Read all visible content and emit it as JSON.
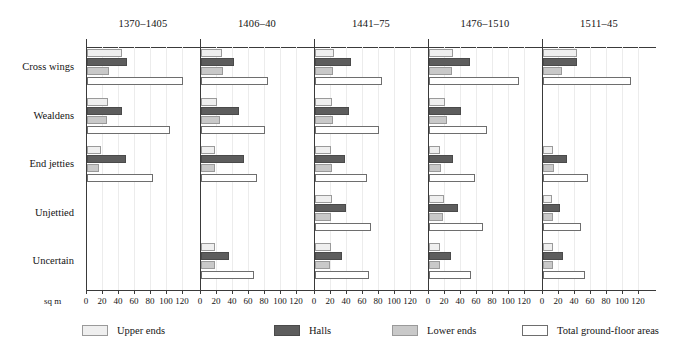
{
  "chart_data": {
    "type": "bar",
    "orientation": "horizontal",
    "title": "",
    "xlabel": "sq m",
    "ylabel": "",
    "xlim": [
      0,
      120
    ],
    "xticks": [
      0,
      20,
      40,
      60,
      80,
      100,
      120
    ],
    "grid": true,
    "legend_position": "bottom",
    "panel_titles": [
      "1370–1405",
      "1406–40",
      "1441–75",
      "1476–1510",
      "1511–45"
    ],
    "categories": [
      "Cross wings",
      "Wealdens",
      "End jetties",
      "Unjettied",
      "Uncertain"
    ],
    "series_names": [
      "Upper ends",
      "Halls",
      "Lower ends",
      "Total ground-floor areas"
    ],
    "series_colors": {
      "upper_ends": "#efefef",
      "halls": "#5d5d5d",
      "lower_ends": "#c9c9c9",
      "total_ground_floor_areas": "#ffffff"
    },
    "panels": [
      {
        "title": "1370–1405",
        "groups": [
          {
            "category": "Cross wings",
            "values": {
              "upper_ends": 44,
              "halls": 50,
              "lower_ends": 27,
              "total_ground_floor_areas": 120
            }
          },
          {
            "category": "Wealdens",
            "values": {
              "upper_ends": 26,
              "halls": 44,
              "lower_ends": 25,
              "total_ground_floor_areas": 104
            }
          },
          {
            "category": "End jetties",
            "values": {
              "upper_ends": 18,
              "halls": 49,
              "lower_ends": 15,
              "total_ground_floor_areas": 83
            }
          },
          {
            "category": "Unjettied",
            "values": {
              "upper_ends": 0,
              "halls": 0,
              "lower_ends": 0,
              "total_ground_floor_areas": 0
            }
          },
          {
            "category": "Uncertain",
            "values": {
              "upper_ends": 0,
              "halls": 0,
              "lower_ends": 0,
              "total_ground_floor_areas": 0
            }
          }
        ]
      },
      {
        "title": "1406–40",
        "groups": [
          {
            "category": "Cross wings",
            "values": {
              "upper_ends": 26,
              "halls": 41,
              "lower_ends": 28,
              "total_ground_floor_areas": 84
            }
          },
          {
            "category": "Wealdens",
            "values": {
              "upper_ends": 20,
              "halls": 48,
              "lower_ends": 24,
              "total_ground_floor_areas": 80
            }
          },
          {
            "category": "End jetties",
            "values": {
              "upper_ends": 17,
              "halls": 54,
              "lower_ends": 17,
              "total_ground_floor_areas": 70
            }
          },
          {
            "category": "Unjettied",
            "values": {
              "upper_ends": 0,
              "halls": 0,
              "lower_ends": 0,
              "total_ground_floor_areas": 0
            }
          },
          {
            "category": "Uncertain",
            "values": {
              "upper_ends": 17,
              "halls": 35,
              "lower_ends": 18,
              "total_ground_floor_areas": 66
            }
          }
        ]
      },
      {
        "title": "1441–75",
        "groups": [
          {
            "category": "Cross wings",
            "values": {
              "upper_ends": 24,
              "halls": 45,
              "lower_ends": 23,
              "total_ground_floor_areas": 84
            }
          },
          {
            "category": "Wealdens",
            "values": {
              "upper_ends": 21,
              "halls": 43,
              "lower_ends": 22,
              "total_ground_floor_areas": 80
            }
          },
          {
            "category": "End jetties",
            "values": {
              "upper_ends": 20,
              "halls": 38,
              "lower_ends": 21,
              "total_ground_floor_areas": 65
            }
          },
          {
            "category": "Unjettied",
            "values": {
              "upper_ends": 21,
              "halls": 39,
              "lower_ends": 20,
              "total_ground_floor_areas": 70
            }
          },
          {
            "category": "Uncertain",
            "values": {
              "upper_ends": 20,
              "halls": 34,
              "lower_ends": 19,
              "total_ground_floor_areas": 68
            }
          }
        ]
      },
      {
        "title": "1476–1510",
        "groups": [
          {
            "category": "Cross wings",
            "values": {
              "upper_ends": 30,
              "halls": 51,
              "lower_ends": 29,
              "total_ground_floor_areas": 113
            }
          },
          {
            "category": "Wealdens",
            "values": {
              "upper_ends": 20,
              "halls": 40,
              "lower_ends": 23,
              "total_ground_floor_areas": 73
            }
          },
          {
            "category": "End jetties",
            "values": {
              "upper_ends": 14,
              "halls": 30,
              "lower_ends": 15,
              "total_ground_floor_areas": 57
            }
          },
          {
            "category": "Unjettied",
            "values": {
              "upper_ends": 19,
              "halls": 36,
              "lower_ends": 18,
              "total_ground_floor_areas": 68
            }
          },
          {
            "category": "Uncertain",
            "values": {
              "upper_ends": 14,
              "halls": 28,
              "lower_ends": 14,
              "total_ground_floor_areas": 52
            }
          }
        ]
      },
      {
        "title": "1511–45",
        "groups": [
          {
            "category": "Cross wings",
            "values": {
              "upper_ends": 42,
              "halls": 43,
              "lower_ends": 24,
              "total_ground_floor_areas": 110
            }
          },
          {
            "category": "Wealdens",
            "values": {
              "upper_ends": 0,
              "halls": 0,
              "lower_ends": 0,
              "total_ground_floor_areas": 0
            }
          },
          {
            "category": "End jetties",
            "values": {
              "upper_ends": 13,
              "halls": 30,
              "lower_ends": 14,
              "total_ground_floor_areas": 56
            }
          },
          {
            "category": "Unjettied",
            "values": {
              "upper_ends": 11,
              "halls": 21,
              "lower_ends": 12,
              "total_ground_floor_areas": 47
            }
          },
          {
            "category": "Uncertain",
            "values": {
              "upper_ends": 13,
              "halls": 25,
              "lower_ends": 13,
              "total_ground_floor_areas": 52
            }
          }
        ]
      }
    ]
  },
  "axis": {
    "unit_label": "sq m",
    "tick_labels": [
      "0",
      "20",
      "40",
      "60",
      "80",
      "100",
      "120"
    ]
  },
  "legend": {
    "items": [
      {
        "label": "Upper ends",
        "swatch": "upper"
      },
      {
        "label": "Halls",
        "swatch": "halls"
      },
      {
        "label": "Lower ends",
        "swatch": "lower"
      },
      {
        "label": "Total ground-floor areas",
        "swatch": "total"
      }
    ]
  }
}
